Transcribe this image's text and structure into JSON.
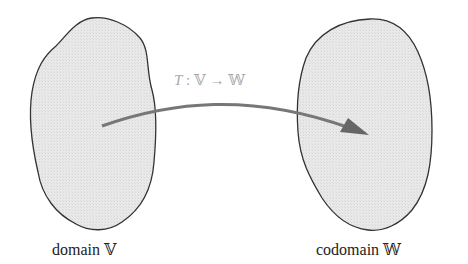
{
  "diagram": {
    "type": "function-mapping",
    "domain": {
      "label": "domain 𝕍",
      "fill": "#e6e6e6",
      "stroke": "#333333"
    },
    "codomain": {
      "label": "codomain 𝕎",
      "fill": "#e6e6e6",
      "stroke": "#333333"
    },
    "mapping": {
      "name": "T",
      "separator": " : ",
      "from": "𝕍",
      "arrow": " → ",
      "to": "𝕎",
      "color": "#777777",
      "label_color": "#a8a8a8"
    }
  }
}
